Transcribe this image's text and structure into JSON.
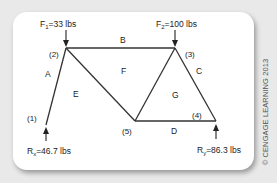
{
  "diagram": {
    "type": "truss",
    "nodes": [
      {
        "id": "1",
        "label": "(1)"
      },
      {
        "id": "2",
        "label": "(2)"
      },
      {
        "id": "3",
        "label": "(3)"
      },
      {
        "id": "4",
        "label": "(4)"
      },
      {
        "id": "5",
        "label": "(5)"
      }
    ],
    "members": [
      {
        "from": "1",
        "to": "2"
      },
      {
        "from": "2",
        "to": "3"
      },
      {
        "from": "2",
        "to": "5"
      },
      {
        "from": "3",
        "to": "5"
      },
      {
        "from": "3",
        "to": "4"
      },
      {
        "from": "5",
        "to": "4"
      }
    ],
    "spaces": [
      "A",
      "B",
      "C",
      "D",
      "E",
      "F",
      "G"
    ],
    "loads": {
      "f1": {
        "name": "F",
        "sub": "1",
        "value": "=33 lbs",
        "node": "2",
        "direction": "down"
      },
      "f2": {
        "name": "F",
        "sub": "2",
        "value": "=100 lbs",
        "node": "3",
        "direction": "down"
      }
    },
    "reactions": {
      "rx": {
        "name": "R",
        "sub": "x",
        "value": "=46.7 lbs",
        "node": "1",
        "direction": "up"
      },
      "ry": {
        "name": "R",
        "sub": "y",
        "value": "=86.3 lbs",
        "node": "4",
        "direction": "up"
      }
    }
  },
  "copyright": "© CENGAGE LEARNING 2013"
}
